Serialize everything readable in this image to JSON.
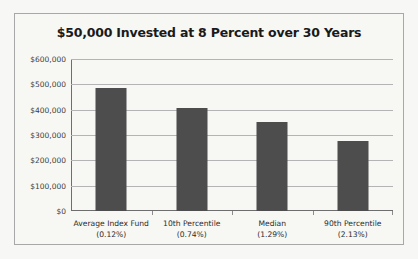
{
  "chart_data": {
    "type": "bar",
    "title": "$50,000 Invested at 8 Percent over 30 Years",
    "xlabel": "",
    "ylabel": "",
    "categories": [
      "Average Index Fund",
      "10th Percentile",
      "Median",
      "90th Percentile"
    ],
    "category_sublabels": [
      "(0.12%)",
      "(0.74%)",
      "(1.29%)",
      "(2.13%)"
    ],
    "values": [
      485000,
      408000,
      350000,
      278000
    ],
    "ylim": [
      0,
      600000
    ],
    "ytick_labels": [
      "$600,000",
      "$500,000",
      "$400,000",
      "$300,000",
      "$200,000",
      "$100,000",
      "$0"
    ],
    "ytick_values": [
      600000,
      500000,
      400000,
      300000,
      200000,
      100000,
      0
    ],
    "grid": true,
    "legend": false,
    "colors": {
      "bar": "#4d4d4d",
      "gridline": "#b4b4b4",
      "axis": "#6e6e6e",
      "frame_border": "#a8a8a8",
      "plot_background": "#f7f7f4",
      "title_text": "#1a1a1a",
      "tick_text": "#3d3d3d"
    }
  }
}
